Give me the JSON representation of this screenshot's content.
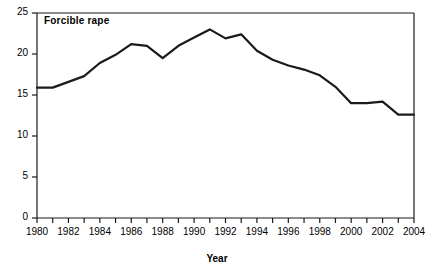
{
  "chart_data": {
    "type": "line",
    "title": "Forcible rape",
    "xlabel": "Year",
    "ylabel": "",
    "xlim": [
      1980,
      2004
    ],
    "ylim": [
      0,
      25
    ],
    "grid": false,
    "legend": "none",
    "series_label": "Forcible rape",
    "y_ticks": [
      0,
      5,
      10,
      15,
      20,
      25
    ],
    "y_tick_labels": [
      "0",
      "5",
      "10",
      "15",
      "20",
      "25"
    ],
    "x_ticks": [
      1980,
      1981,
      1982,
      1983,
      1984,
      1985,
      1986,
      1987,
      1988,
      1989,
      1990,
      1991,
      1992,
      1993,
      1994,
      1995,
      1996,
      1997,
      1998,
      1999,
      2000,
      2001,
      2002,
      2003,
      2004
    ],
    "x_tick_labels": [
      "1980",
      "",
      "1982",
      "",
      "1984",
      "",
      "1986",
      "",
      "1988",
      "",
      "1990",
      "",
      "1992",
      "",
      "1994",
      "",
      "1996",
      "",
      "1998",
      "",
      "2000",
      "",
      "2002",
      "",
      "2004"
    ],
    "x": [
      1980,
      1981,
      1982,
      1983,
      1984,
      1985,
      1986,
      1987,
      1988,
      1989,
      1990,
      1991,
      1992,
      1993,
      1994,
      1995,
      1996,
      1997,
      1998,
      1999,
      2000,
      2001,
      2002,
      2003,
      2004
    ],
    "values": [
      15.9,
      15.9,
      16.6,
      17.3,
      18.9,
      19.9,
      21.2,
      21.0,
      19.5,
      21.0,
      22.0,
      23.0,
      21.9,
      22.4,
      20.4,
      19.3,
      18.6,
      18.1,
      17.4,
      16.0,
      14.0,
      14.0,
      14.2,
      12.6,
      12.6
    ],
    "line_color": "#1a1a1a",
    "line_width": 2.2
  }
}
